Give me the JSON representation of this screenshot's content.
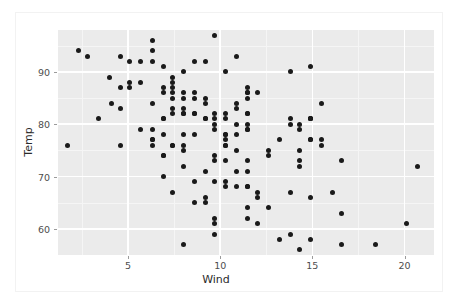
{
  "chart_data": {
    "type": "scatter",
    "title": "",
    "xlabel": "Wind",
    "ylabel": "Temp",
    "xlim": [
      1.2,
      21.6
    ],
    "ylim": [
      55.0,
      98.0
    ],
    "grid": true,
    "legend": null,
    "xticks": [
      5,
      10,
      15,
      20
    ],
    "xticklabels": [
      "5",
      "10",
      "15",
      "20"
    ],
    "yticks": [
      60,
      70,
      80,
      90
    ],
    "yticklabels": [
      "60",
      "70",
      "80",
      "90"
    ],
    "xminor": [
      2.5,
      7.5,
      12.5,
      17.5
    ],
    "yminor": [
      55,
      65,
      75,
      85,
      95
    ],
    "point_color": "#1a1a1a",
    "panel_background": "#ebebeb",
    "grid_color": "#ffffff",
    "n_points": 153,
    "x": [
      7.4,
      8.0,
      12.6,
      11.5,
      14.3,
      14.9,
      8.6,
      13.8,
      20.1,
      8.6,
      6.9,
      9.7,
      9.2,
      10.9,
      13.2,
      11.5,
      12.0,
      18.4,
      11.5,
      9.7,
      9.7,
      16.6,
      9.7,
      12.0,
      16.6,
      14.9,
      8.0,
      12.0,
      14.9,
      5.7,
      7.4,
      8.6,
      9.7,
      16.1,
      9.2,
      8.6,
      14.3,
      9.7,
      6.9,
      13.8,
      11.5,
      10.9,
      9.2,
      8.0,
      13.8,
      11.5,
      14.9,
      20.7,
      9.2,
      11.5,
      10.3,
      6.3,
      1.7,
      4.6,
      6.3,
      8.0,
      8.0,
      10.3,
      11.5,
      14.9,
      8.0,
      4.1,
      9.2,
      9.2,
      10.9,
      4.6,
      10.9,
      5.1,
      6.3,
      5.7,
      7.4,
      8.6,
      14.3,
      14.9,
      14.9,
      14.3,
      6.9,
      10.3,
      6.3,
      5.1,
      11.5,
      6.9,
      9.7,
      11.5,
      8.6,
      8.0,
      8.6,
      12.0,
      7.4,
      7.4,
      7.4,
      9.2,
      6.9,
      13.8,
      7.4,
      6.9,
      7.4,
      4.6,
      4.0,
      10.3,
      8.0,
      8.6,
      11.5,
      11.5,
      11.5,
      9.7,
      11.5,
      10.3,
      6.3,
      7.4,
      10.9,
      10.3,
      15.5,
      14.3,
      12.6,
      9.7,
      3.4,
      8.0,
      5.7,
      9.7,
      2.3,
      6.3,
      6.3,
      6.9,
      5.1,
      2.8,
      4.6,
      7.4,
      15.5,
      10.9,
      10.3,
      10.9,
      9.7,
      14.9,
      15.5,
      6.3,
      10.9,
      11.5,
      6.9,
      13.8,
      10.3,
      10.3,
      8.0,
      12.6,
      9.2,
      10.3,
      10.3,
      16.6,
      6.9,
      13.2,
      14.3,
      8.0,
      11.5
    ],
    "y": [
      67,
      72,
      74,
      62,
      56,
      66,
      65,
      59,
      61,
      69,
      74,
      69,
      66,
      68,
      58,
      64,
      66,
      57,
      68,
      62,
      59,
      73,
      61,
      61,
      57,
      58,
      57,
      67,
      81,
      79,
      76,
      78,
      74,
      67,
      84,
      85,
      79,
      82,
      87,
      90,
      87,
      93,
      92,
      82,
      80,
      79,
      77,
      72,
      65,
      73,
      76,
      77,
      76,
      76,
      76,
      75,
      78,
      73,
      80,
      77,
      83,
      84,
      85,
      81,
      84,
      83,
      83,
      88,
      92,
      92,
      89,
      82,
      73,
      81,
      91,
      80,
      81,
      82,
      84,
      87,
      85,
      74,
      81,
      82,
      86,
      85,
      82,
      86,
      88,
      86,
      83,
      81,
      81,
      81,
      82,
      86,
      85,
      87,
      89,
      90,
      90,
      92,
      86,
      86,
      82,
      80,
      79,
      77,
      79,
      76,
      78,
      78,
      77,
      72,
      75,
      79,
      81,
      86,
      88,
      97,
      94,
      96,
      94,
      91,
      92,
      93,
      93,
      87,
      84,
      80,
      78,
      75,
      73,
      81,
      76,
      77,
      71,
      71,
      78,
      67,
      76,
      68,
      82,
      64,
      71,
      81,
      69,
      63,
      70,
      77,
      75,
      76,
      68
    ]
  },
  "axis": {
    "x_title": "Wind",
    "y_title": "Temp"
  }
}
